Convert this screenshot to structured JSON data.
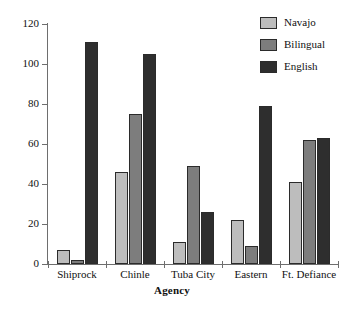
{
  "chart_data": {
    "type": "bar",
    "title": "",
    "xlabel": "Agency",
    "ylabel": "",
    "categories": [
      "Shiprock",
      "Chinle",
      "Tuba City",
      "Eastern",
      "Ft. Defiance"
    ],
    "series": [
      {
        "name": "Navajo",
        "color": "#bdbdbd",
        "values": [
          7,
          46,
          11,
          22,
          41
        ]
      },
      {
        "name": "Bilingual",
        "color": "#7d7d7d",
        "values": [
          2,
          75,
          49,
          9,
          62
        ]
      },
      {
        "name": "English",
        "color": "#2e2e2e",
        "values": [
          111,
          105,
          26,
          79,
          63
        ]
      }
    ],
    "ylim": [
      0,
      120
    ],
    "yticks": [
      0,
      20,
      40,
      60,
      80,
      100,
      120
    ],
    "ytick_labels": [
      "0",
      "20",
      "40",
      "60",
      "80",
      "100",
      "120"
    ],
    "grid": false,
    "legend_position": "top-right",
    "axis_color": "#6e6e6e",
    "bar_edge_color": "#2b2b2b",
    "background": "#ffffff"
  }
}
